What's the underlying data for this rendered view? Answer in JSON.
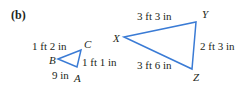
{
  "panel_label": "(b)",
  "stroke_color": "#3a7bd5",
  "small_triangle": {
    "vertices": {
      "A": "A",
      "B": "B",
      "C": "C"
    },
    "sides": {
      "BC": "1 ft 2 in",
      "CA": "1 ft 1 in",
      "AB": "9 in"
    }
  },
  "large_triangle": {
    "vertices": {
      "X": "X",
      "Y": "Y",
      "Z": "Z"
    },
    "sides": {
      "XY": "3 ft 3 in",
      "YZ": "2 ft 3 in",
      "XZ": "3 ft 6 in"
    }
  }
}
